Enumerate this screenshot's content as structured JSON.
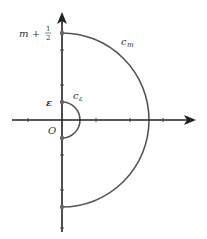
{
  "diagram": {
    "type": "contour",
    "colors": {
      "axis": "#222222",
      "arc": "#555555",
      "dot": "#666666",
      "text": "#333333"
    },
    "origin": {
      "x": 62,
      "y": 120
    },
    "axes": {
      "horizontal": {
        "from": [
          12,
          120
        ],
        "to": [
          196,
          120
        ],
        "ticks_x": [
          28,
          96,
          130,
          163
        ]
      },
      "vertical": {
        "from": [
          62,
          232
        ],
        "to": [
          62,
          12
        ],
        "ticks_y": [
          50,
          85,
          155,
          190,
          228
        ]
      }
    },
    "arcs": [
      {
        "name": "c_m",
        "radius": 87,
        "label": "c",
        "subscript": "m"
      },
      {
        "name": "c_epsilon",
        "radius": 18,
        "label": "c",
        "subscript": "ε"
      }
    ],
    "labels": {
      "top": {
        "main": "m + ",
        "frac_num": "1",
        "frac_den": "2"
      },
      "epsilon": "ε",
      "origin": "O",
      "c_m_main": "c",
      "c_m_sub": "m",
      "c_eps_main": "c",
      "c_eps_sub": "ε"
    }
  }
}
